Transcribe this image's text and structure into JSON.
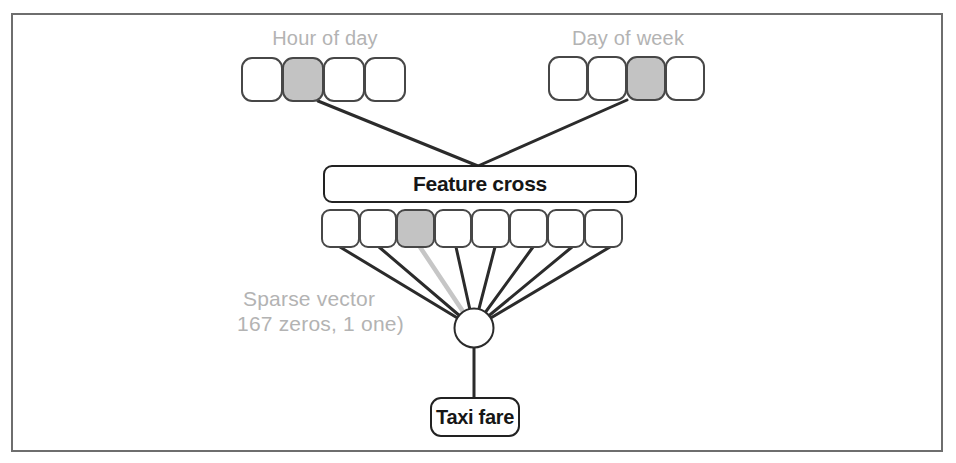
{
  "diagram": {
    "inputs": [
      {
        "label": "Hour of day",
        "cells": 4,
        "active_index": 1
      },
      {
        "label": "Day of week",
        "cells": 4,
        "active_index": 2
      }
    ],
    "feature_cross": {
      "label": "Feature cross"
    },
    "crossed_vector": {
      "cells": 8,
      "active_index": 2
    },
    "sparse_caption": {
      "line1": "Sparse vector",
      "line2": "167 zeros, 1 one)"
    },
    "output": {
      "label": "Taxi fare"
    },
    "colors": {
      "edge": "#2b2b2b",
      "active_cell": "#c3c3c3",
      "active_edge": "#c6c6c6",
      "caption_text": "#b3b3b3",
      "frame_border": "#6e6e6e"
    }
  }
}
